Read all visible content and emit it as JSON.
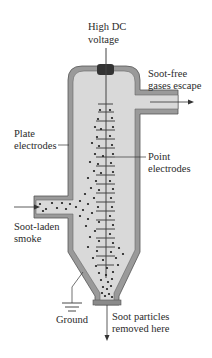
{
  "diagram": {
    "labels": {
      "voltage_line1": "High DC",
      "voltage_line2": "voltage",
      "outlet_line1": "Soot-free",
      "outlet_line2": "gases escape",
      "plate_line1": "Plate",
      "plate_line2": "electrodes",
      "point_line1": "Point",
      "point_line2": "electrodes",
      "inlet_line1": "Soot-laden",
      "inlet_line2": "smoke",
      "ground": "Ground",
      "removal_line1": "Soot particles",
      "removal_line2": "removed here"
    },
    "colors": {
      "wall": "#9a9a9a",
      "wall_stroke": "#555555",
      "interior": "#d9d9d9",
      "rod": "#444444",
      "insulator": "#333333",
      "particle": "#1a1a1a",
      "text": "#2b2b2b"
    }
  }
}
